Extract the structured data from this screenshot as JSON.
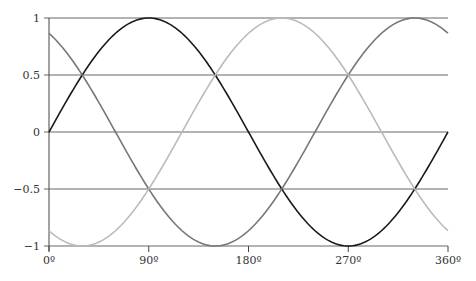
{
  "chart_data": {
    "type": "line",
    "title": "",
    "xlabel": "",
    "ylabel": "",
    "xlim": [
      0,
      360
    ],
    "ylim": [
      -1,
      1
    ],
    "grid": "horizontal",
    "legend": null,
    "x_ticks": [
      0,
      90,
      180,
      270,
      360
    ],
    "x_tick_labels": [
      "0º",
      "90º",
      "180º",
      "270º",
      "360º"
    ],
    "y_ticks": [
      1,
      0.5,
      0,
      -0.5,
      -1
    ],
    "y_tick_labels": [
      "1",
      "0.5",
      "0",
      "−0.5",
      "−1"
    ],
    "series": [
      {
        "name": "sin(x)",
        "phase_deg": 0,
        "color": "#1a1a1a",
        "x": [
          0,
          30,
          60,
          90,
          120,
          150,
          180,
          210,
          240,
          270,
          300,
          330,
          360
        ],
        "values": [
          0,
          0.5,
          0.866,
          1,
          0.866,
          0.5,
          0,
          -0.5,
          -0.866,
          -1,
          -0.866,
          -0.5,
          0
        ]
      },
      {
        "name": "sin(x+120°)",
        "phase_deg": 120,
        "color": "#777777",
        "x": [
          0,
          30,
          60,
          90,
          120,
          150,
          180,
          210,
          240,
          270,
          300,
          330,
          360
        ],
        "values": [
          0.866,
          0.5,
          0,
          -0.5,
          -0.866,
          -1,
          -0.866,
          -0.5,
          0,
          0.5,
          0.866,
          1,
          0.866
        ]
      },
      {
        "name": "sin(x+240°)",
        "phase_deg": 240,
        "color": "#bbbbbb",
        "x": [
          0,
          30,
          60,
          90,
          120,
          150,
          180,
          210,
          240,
          270,
          300,
          330,
          360
        ],
        "values": [
          -0.866,
          -1,
          -0.866,
          -0.5,
          0,
          0.5,
          0.866,
          1,
          0.866,
          0.5,
          0,
          -0.5,
          -0.866
        ]
      }
    ]
  },
  "colors": {
    "grid": "#666666",
    "axis": "#444444",
    "text": "#333333"
  }
}
